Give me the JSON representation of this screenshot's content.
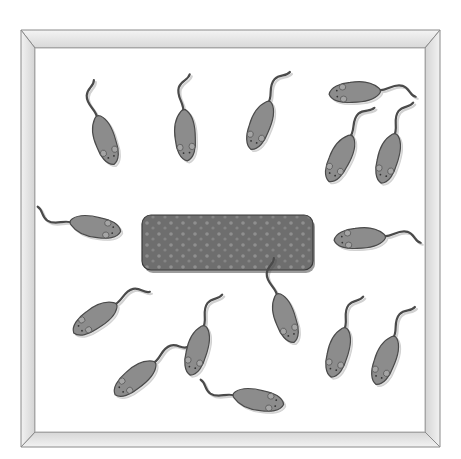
{
  "scene": {
    "description": "Illustration of a box enclosure viewed from above, with mice arranged around a central food bar",
    "enclosure": {
      "outer": {
        "x": 21,
        "y": 30,
        "w": 419,
        "h": 417
      },
      "inner": {
        "x": 35,
        "y": 48,
        "w": 390,
        "h": 384
      },
      "frame_color": "#e6e6e6",
      "frame_edge_color": "#8a8a8a"
    },
    "food_bar": {
      "x": 142,
      "y": 215,
      "w": 171,
      "h": 55,
      "color": "#6e6e6e",
      "dot_color": "#8a8a8a"
    },
    "mouse_color": "#8c8c8c",
    "mouse_outline": "#4a4a4a",
    "mice": [
      {
        "x": 105,
        "y": 140,
        "angle": 160
      },
      {
        "x": 185,
        "y": 135,
        "angle": 175
      },
      {
        "x": 260,
        "y": 125,
        "angle": 200
      },
      {
        "x": 355,
        "y": 92,
        "angle": 265
      },
      {
        "x": 340,
        "y": 158,
        "angle": 205
      },
      {
        "x": 388,
        "y": 158,
        "angle": 195
      },
      {
        "x": 95,
        "y": 227,
        "angle": 100
      },
      {
        "x": 360,
        "y": 238,
        "angle": 265
      },
      {
        "x": 95,
        "y": 318,
        "angle": 235
      },
      {
        "x": 135,
        "y": 378,
        "angle": 230
      },
      {
        "x": 197,
        "y": 350,
        "angle": 195
      },
      {
        "x": 285,
        "y": 318,
        "angle": 160
      },
      {
        "x": 338,
        "y": 352,
        "angle": 195
      },
      {
        "x": 385,
        "y": 360,
        "angle": 200
      },
      {
        "x": 258,
        "y": 400,
        "angle": 100
      }
    ]
  }
}
